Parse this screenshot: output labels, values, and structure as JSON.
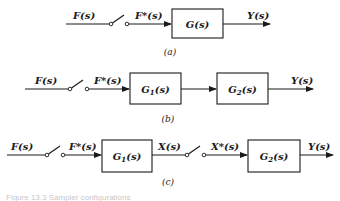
{
  "diagrams": {
    "a": {
      "caption": "(a)",
      "input": "F(s)",
      "sampled": "F*(s)",
      "block": "G(s)",
      "output": "Y(s)"
    },
    "b": {
      "caption": "(b)",
      "input": "F(s)",
      "sampled": "F*(s)",
      "block1": {
        "main": "G",
        "sub": "1",
        "arg": "(s)"
      },
      "block2": {
        "main": "G",
        "sub": "2",
        "arg": "(s)"
      },
      "output": "Y(s)"
    },
    "c": {
      "caption": "(c)",
      "input": "F(s)",
      "sampled": "F*(s)",
      "block1": {
        "main": "G",
        "sub": "1",
        "arg": "(s)"
      },
      "intermediate": "X(s)",
      "intermediate_sampled": "X*(s)",
      "block2": {
        "main": "G",
        "sub": "2",
        "arg": "(s)"
      },
      "output": "Y(s)"
    }
  },
  "figure_caption": "Figure 13.3 Sampler configurations"
}
